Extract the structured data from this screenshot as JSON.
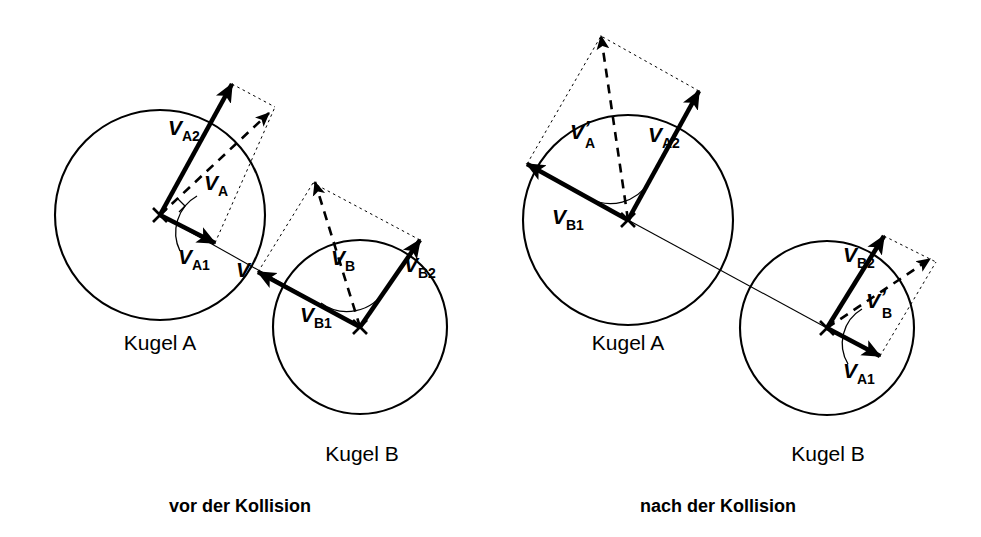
{
  "figure": {
    "background_color": "#ffffff",
    "stroke_color": "#000000",
    "width": 981,
    "height": 537
  },
  "panels": [
    {
      "id": "before",
      "caption": "vor der Kollision",
      "caption_x": 240,
      "caption_y": 512,
      "balls": [
        {
          "id": "A",
          "label": "Kugel A",
          "label_x": 160,
          "label_y": 350,
          "cx": 160,
          "cy": 215,
          "r": 105
        },
        {
          "id": "B",
          "label": "Kugel B",
          "label_x": 362,
          "label_y": 461,
          "cx": 360,
          "cy": 327,
          "r": 87
        }
      ],
      "contact_point": {
        "label": "V",
        "x": 249,
        "y": 268,
        "label_x": 236,
        "label_y": 277
      },
      "vectors": [
        {
          "name": "v_A2",
          "label": "V",
          "sub": "A2",
          "prime": false,
          "style": "solid",
          "x1": 160,
          "y1": 215,
          "x2": 232,
          "y2": 84,
          "label_x": 168,
          "label_y": 135
        },
        {
          "name": "v_A1",
          "label": "V",
          "sub": "A1",
          "prime": false,
          "style": "solid",
          "x1": 160,
          "y1": 215,
          "x2": 215,
          "y2": 243,
          "label_x": 178,
          "label_y": 264
        },
        {
          "name": "v_A",
          "label": "V",
          "sub": "A",
          "prime": false,
          "style": "dashed",
          "x1": 160,
          "y1": 215,
          "x2": 269,
          "y2": 113,
          "label_x": 204,
          "label_y": 190
        }
      ],
      "construction_lines": [
        {
          "from_x": 232,
          "from_y": 84,
          "to_x": 275,
          "to_y": 107
        },
        {
          "from_x": 215,
          "from_y": 243,
          "to_x": 275,
          "to_y": 107
        }
      ],
      "angle_arcs": [
        {
          "cx": 160,
          "cy": 215,
          "r": 42,
          "start_deg": 27,
          "end_deg": -61
        }
      ],
      "vectors_b": [
        {
          "name": "v_B1",
          "label": "V",
          "sub": "B1",
          "prime": false,
          "style": "solid",
          "x1": 360,
          "y1": 327,
          "x2": 258,
          "y2": 272,
          "label_x": 300,
          "label_y": 322
        },
        {
          "name": "v_B2",
          "label": "V",
          "sub": "B2",
          "prime": false,
          "style": "solid",
          "x1": 360,
          "y1": 327,
          "x2": 420,
          "y2": 240,
          "label_x": 404,
          "label_y": 272
        },
        {
          "name": "v_B",
          "label": "V",
          "sub": "B",
          "prime": false,
          "style": "dashed",
          "x1": 360,
          "y1": 327,
          "x2": 315,
          "y2": 182,
          "label_x": 331,
          "label_y": 265
        }
      ],
      "construction_lines_b": [
        {
          "from_x": 258,
          "from_y": 272,
          "to_x": 313,
          "to_y": 183
        },
        {
          "from_x": 420,
          "from_y": 240,
          "to_x": 313,
          "to_y": 183
        }
      ],
      "angle_arcs_b": [
        {
          "cx": 360,
          "cy": 327,
          "r": 44,
          "start_deg": 208,
          "end_deg": 304
        }
      ]
    },
    {
      "id": "after",
      "caption": "nach der Kollision",
      "caption_x": 718,
      "caption_y": 512,
      "balls": [
        {
          "id": "A",
          "label": "Kugel A",
          "label_x": 628,
          "label_y": 350,
          "cx": 628,
          "cy": 220,
          "r": 105
        },
        {
          "id": "B",
          "label": "Kugel B",
          "label_x": 828,
          "label_y": 461,
          "cx": 827,
          "cy": 328,
          "r": 87
        }
      ],
      "vectors": [
        {
          "name": "v_A2",
          "label": "V",
          "sub": "A2",
          "prime": false,
          "style": "solid",
          "x1": 628,
          "y1": 220,
          "x2": 699,
          "y2": 91,
          "label_x": 648,
          "label_y": 142
        },
        {
          "name": "v_B1",
          "label": "V",
          "sub": "B1",
          "prime": false,
          "style": "solid",
          "x1": 628,
          "y1": 220,
          "x2": 527,
          "y2": 164,
          "label_x": 552,
          "label_y": 224
        },
        {
          "name": "v_A_prime",
          "label": "V",
          "sub": "A",
          "prime": true,
          "style": "dashed",
          "x1": 628,
          "y1": 220,
          "x2": 601,
          "y2": 36,
          "label_x": 576,
          "label_y": 137
        }
      ],
      "construction_lines": [
        {
          "from_x": 699,
          "from_y": 91,
          "to_x": 601,
          "to_y": 36
        },
        {
          "from_x": 527,
          "from_y": 164,
          "to_x": 601,
          "to_y": 36
        }
      ],
      "angle_arcs": [
        {
          "cx": 628,
          "cy": 220,
          "r": 45,
          "start_deg": 209,
          "end_deg": 298
        }
      ],
      "vectors_b": [
        {
          "name": "v_B2",
          "label": "V",
          "sub": "B2",
          "prime": false,
          "style": "solid",
          "x1": 827,
          "y1": 328,
          "x2": 884,
          "y2": 236,
          "label_x": 848,
          "label_y": 262
        },
        {
          "name": "v_A1",
          "label": "V",
          "sub": "A1",
          "prime": false,
          "style": "solid",
          "x1": 827,
          "y1": 328,
          "x2": 880,
          "y2": 356,
          "label_x": 843,
          "label_y": 378
        },
        {
          "name": "v_B_prime",
          "label": "V",
          "sub": "B",
          "prime": true,
          "style": "dashed",
          "x1": 827,
          "y1": 328,
          "x2": 930,
          "y2": 259,
          "label_x": 870,
          "label_y": 302
        }
      ],
      "construction_lines_b": [
        {
          "from_x": 884,
          "from_y": 236,
          "to_x": 936,
          "to_y": 262
        },
        {
          "from_x": 880,
          "from_y": 356,
          "to_x": 936,
          "to_y": 262
        }
      ],
      "angle_arcs_b": [
        {
          "cx": 827,
          "cy": 328,
          "r": 40,
          "start_deg": 28,
          "end_deg": -58
        }
      ]
    }
  ],
  "labels": {
    "kugel_a": "Kugel A",
    "kugel_b": "Kugel B",
    "caption_before": "vor der Kollision",
    "caption_after": "nach der Kollision",
    "contact_point": "V",
    "v_a1": "A1",
    "v_a2": "A2",
    "v_a": "A",
    "v_b1": "B1",
    "v_b2": "B2",
    "v_b": "B",
    "v_symbol": "V",
    "prime_symbol": "’"
  }
}
